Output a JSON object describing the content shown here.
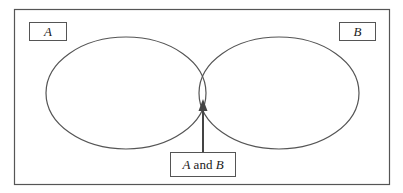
{
  "diagram": {
    "type": "venn",
    "sets": [
      {
        "id": "A",
        "label": "A"
      },
      {
        "id": "B",
        "label": "B"
      }
    ],
    "intersection": {
      "label_part1": "A",
      "label_connector": " and ",
      "label_part2": "B"
    },
    "colors": {
      "stroke": "#555555",
      "background": "#ffffff"
    }
  }
}
